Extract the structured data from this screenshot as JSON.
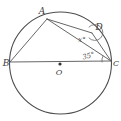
{
  "figure": {
    "type": "geometry-diagram",
    "colors": {
      "ink": "#555555",
      "background": "#ffffff"
    },
    "points": {
      "a": "A",
      "b": "B",
      "c": "C",
      "d": "D",
      "o": "O"
    },
    "angles": {
      "at_d": "x°",
      "at_c": "35°"
    }
  }
}
